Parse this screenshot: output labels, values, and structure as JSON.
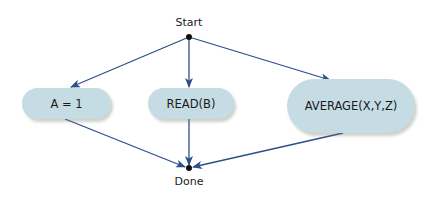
{
  "diagram": {
    "type": "flowchart",
    "start": {
      "label": "Start",
      "x": 189,
      "y": 37
    },
    "end": {
      "label": "Done",
      "x": 189,
      "y": 168
    },
    "nodes": [
      {
        "id": "n1",
        "label": "A = 1",
        "x": 22,
        "y": 88,
        "w": 89,
        "h": 31
      },
      {
        "id": "n2",
        "label": "READ(B)",
        "x": 148,
        "y": 88,
        "w": 86,
        "h": 31
      },
      {
        "id": "n3",
        "label": "AVERAGE(X,Y,Z)",
        "x": 287,
        "y": 79,
        "w": 128,
        "h": 54
      }
    ],
    "edges": [
      {
        "from": "start",
        "to": "n1"
      },
      {
        "from": "start",
        "to": "n2"
      },
      {
        "from": "start",
        "to": "n3"
      },
      {
        "from": "n1",
        "to": "end"
      },
      {
        "from": "n2",
        "to": "end"
      },
      {
        "from": "n3",
        "to": "end"
      }
    ],
    "colors": {
      "edge": "#2c4f8c",
      "node_fill": "#c5dce5",
      "dot": "#111111"
    }
  }
}
